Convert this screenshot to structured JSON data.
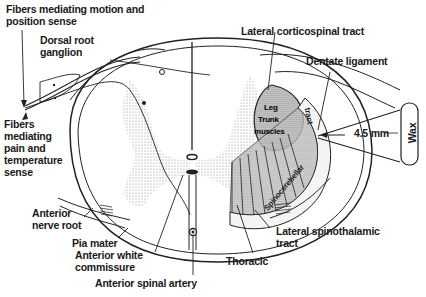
{
  "figure": {
    "labels": {
      "motion_fibers": "Fibers mediating motion and\nposition sense",
      "dorsal_root_ganglion": "Dorsal root\nganglion",
      "lateral_corticospinal": "Lateral corticospinal tract",
      "dentate_ligament": "Dentate ligament",
      "pain_fibers": "Fibers\nmediating\npain and\ntemperature\nsense",
      "anterior_nerve_root": "Anterior\nnerve root",
      "pia_mater": "Pia mater",
      "anterior_white_commissure": "Anterior white\ncommissure",
      "anterior_spinal_artery": "Anterior spinal artery",
      "lateral_spinothalamic": "Lateral spinothalamic\ntract",
      "thoracic": "Thoracic",
      "measurement": "4.5 mm",
      "wax": "Wax",
      "leg": "Leg",
      "trunk": "Trunk",
      "muscles": "muscles",
      "spinocerebellar": "Spinocerebellar",
      "tract_inner": "tract"
    }
  }
}
